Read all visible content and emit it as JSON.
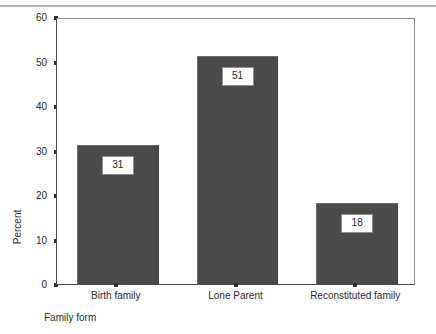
{
  "chart_data": {
    "type": "bar",
    "title": "",
    "subtitle": "",
    "categories": [
      "Birth family",
      "Lone Parent",
      "Reconstituted family"
    ],
    "values": [
      31,
      51,
      18
    ],
    "data_labels": [
      "31",
      "51",
      "18"
    ],
    "xlabel": "Family form",
    "ylabel": "Percent",
    "ylim": [
      0,
      60
    ],
    "yticks": [
      0,
      10,
      20,
      30,
      40,
      50,
      60
    ],
    "ytick_labels": [
      "0",
      "10",
      "20",
      "30",
      "40",
      "50",
      "60"
    ],
    "grid": false,
    "legend": null,
    "bar_color": "#4a4a4a",
    "axis_color": "#4d4d4d",
    "background": "#ffffff"
  }
}
